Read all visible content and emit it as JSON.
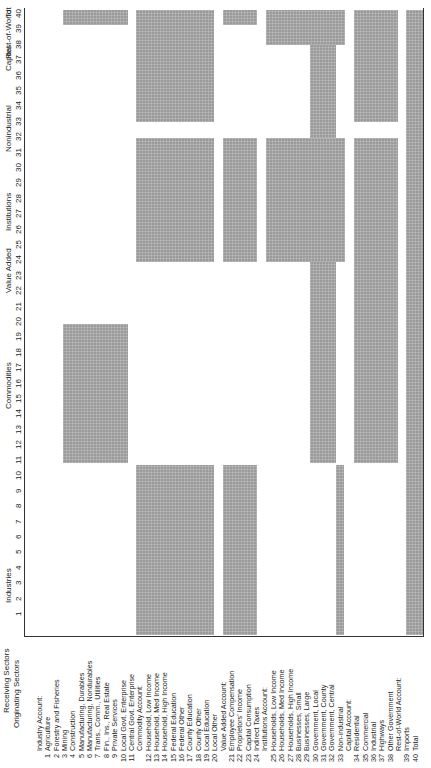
{
  "title": {
    "receiving": "Receiving Sectors",
    "originating": "Originating Sectors"
  },
  "column_groups": [
    {
      "label": "Industries",
      "y": 585
    },
    {
      "label": "Commodities",
      "y": 385
    },
    {
      "label": "Value Added",
      "y": 270
    },
    {
      "label": "Institutions",
      "y": 212
    },
    {
      "label": "Nonindustrial",
      "y": 128
    },
    {
      "label": "Capital",
      "y": 58
    },
    {
      "label": "Rest-of-World",
      "y": 34
    },
    {
      "label": "Tot",
      "y": 12
    }
  ],
  "column_numbers": [
    "1",
    "2",
    "3",
    "4",
    "5",
    "6",
    "7",
    "8",
    "9",
    "10",
    "11",
    "12",
    "13",
    "14",
    "15",
    "16",
    "17",
    "18",
    "19",
    "20",
    "21",
    "22",
    "23",
    "24",
    "25",
    "26",
    "27",
    "28",
    "29",
    "30",
    "31",
    "32",
    "33",
    "34",
    "35",
    "36",
    "37",
    "38",
    "39",
    "40"
  ],
  "rows": [
    {
      "group": "Industry Account:"
    },
    {
      "num": "1",
      "label": "Agriculture"
    },
    {
      "num": "2",
      "label": "Forestry and Fisheries"
    },
    {
      "num": "3",
      "label": "Mining"
    },
    {
      "num": "4",
      "label": "Construction"
    },
    {
      "num": "5",
      "label": "Manufacturing, Durables"
    },
    {
      "num": "6",
      "label": "Manufacturing, Nondurables"
    },
    {
      "num": "7",
      "label": "Trans., Comm., Utilities"
    },
    {
      "num": "8",
      "label": "Fin., Ins., Real Estate"
    },
    {
      "num": "9",
      "label": "Private Services"
    },
    {
      "num": "10",
      "label": "Local Govt. Enterprise"
    },
    {
      "num": "11",
      "label": "Central Govt. Enterprise"
    },
    {
      "group": "Commodity Account:"
    },
    {
      "num": "12",
      "label": "Household, Low Income"
    },
    {
      "num": "13",
      "label": "Household, Med Income"
    },
    {
      "num": "14",
      "label": "Household, High Income"
    },
    {
      "num": "15",
      "label": "Federal Education"
    },
    {
      "num": "16",
      "label": "Federal Other"
    },
    {
      "num": "17",
      "label": "County Education"
    },
    {
      "num": "18",
      "label": "County Other"
    },
    {
      "num": "19",
      "label": "Local Education"
    },
    {
      "num": "20",
      "label": "Local Other"
    },
    {
      "group": "Value Added Account:"
    },
    {
      "num": "21",
      "label": "Employee Compensation"
    },
    {
      "num": "22",
      "label": "Proprietors' Income"
    },
    {
      "num": "23",
      "label": "Capital Consumption"
    },
    {
      "num": "24",
      "label": "Indirect Taxes"
    },
    {
      "group": "Institutions Account:"
    },
    {
      "num": "25",
      "label": "Households, Low Income"
    },
    {
      "num": "26",
      "label": "Households, Med Income"
    },
    {
      "num": "27",
      "label": "Households, High Income"
    },
    {
      "num": "28",
      "label": "Businesses, Small"
    },
    {
      "num": "29",
      "label": "Businesses, Large"
    },
    {
      "num": "30",
      "label": "Government, Local"
    },
    {
      "num": "31",
      "label": "Government, County"
    },
    {
      "num": "32",
      "label": "Government, Central"
    },
    {
      "num": "33",
      "label": "Non-industrial"
    },
    {
      "group": "Capital Account:"
    },
    {
      "num": "34",
      "label": "Residential"
    },
    {
      "num": "35",
      "label": "Commercial"
    },
    {
      "num": "36",
      "label": "Industrial"
    },
    {
      "num": "37",
      "label": "Highways"
    },
    {
      "num": "38",
      "label": "Other Government"
    },
    {
      "group": "Rest-of-World Account:"
    },
    {
      "num": "39",
      "label": "Imports"
    },
    {
      "num": "40",
      "label": "Total"
    }
  ],
  "blocks": [
    {
      "name": "total-row-industries",
      "x": 63,
      "y": 10,
      "w": 65,
      "h": 15
    },
    {
      "name": "commodities-to-industries",
      "x": 63,
      "y": 324,
      "w": 65,
      "h": 139
    },
    {
      "name": "industries-to-commodities-capital",
      "x": 136,
      "y": 10,
      "w": 78,
      "h": 112
    },
    {
      "name": "household-gov-to-institutions",
      "x": 136,
      "y": 138,
      "w": 78,
      "h": 124
    },
    {
      "name": "household-gov-to-industries",
      "x": 136,
      "y": 465,
      "w": 78,
      "h": 170
    },
    {
      "name": "value-added-row-total",
      "x": 223,
      "y": 10,
      "w": 34,
      "h": 15
    },
    {
      "name": "value-added-to-institutions",
      "x": 223,
      "y": 138,
      "w": 34,
      "h": 124
    },
    {
      "name": "value-added-from-industries",
      "x": 223,
      "y": 465,
      "w": 34,
      "h": 170
    },
    {
      "name": "institutions-to-capital-row",
      "x": 266,
      "y": 10,
      "w": 79,
      "h": 35
    },
    {
      "name": "institutions-to-institutions",
      "x": 266,
      "y": 138,
      "w": 79,
      "h": 124
    },
    {
      "name": "institutions-govt-strip",
      "x": 310,
      "y": 45,
      "w": 26,
      "h": 93
    },
    {
      "name": "institutions-govt-strip-lower",
      "x": 310,
      "y": 262,
      "w": 26,
      "h": 201
    },
    {
      "name": "nonindustrial-strip",
      "x": 336,
      "y": 465,
      "w": 8,
      "h": 170
    },
    {
      "name": "capital-upper",
      "x": 354,
      "y": 10,
      "w": 44,
      "h": 112
    },
    {
      "name": "capital-lower",
      "x": 354,
      "y": 138,
      "w": 44,
      "h": 325
    },
    {
      "name": "imports-total",
      "x": 406,
      "y": 10,
      "w": 17,
      "h": 625
    }
  ],
  "colors": {
    "block": "#9a9a9a",
    "line": "#333333",
    "text": "#222222"
  }
}
